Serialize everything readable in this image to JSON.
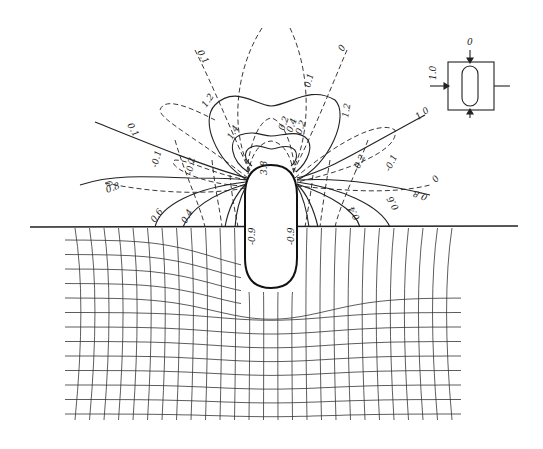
{
  "figure": {
    "type": "stress contour diagram with deformation grid",
    "contour_labels": {
      "solid": [
        "0.1",
        "0.8",
        "0.6",
        "0.4",
        "1.2",
        "1.4",
        "1.0",
        "0.8",
        "0.6",
        "0.4",
        "1.2",
        "3.8",
        "-0.9",
        "-0.9"
      ],
      "dashed": [
        "0.1",
        "0",
        "-0.1",
        "-0.2",
        "0.2",
        "0.4",
        "0.2",
        "0.1",
        "0",
        "-0.1",
        "-0.2"
      ]
    },
    "labels": {
      "top_left_01": "0.1",
      "top_mid_01": "0.1",
      "top_right_0": "0",
      "left_upper_1_2": "1.2",
      "right_upper_1_2": "1.2",
      "inner_1_4": "1.4",
      "inner_0_2a": "0.2",
      "inner_0_4": "0.4",
      "inner_0_2b": "0.2",
      "left_0_1": "0.1",
      "left_neg_0_1": "-0.1",
      "left_neg_0_2": "-0.2",
      "left_0": "0",
      "left_0_8": "0.8",
      "left_0_6": "0.6",
      "left_0_4": "0.4",
      "right_1_0": "1.0",
      "right_neg_0_2": "-0.2",
      "right_neg_0_1": "-0.1",
      "right_0": "0",
      "right_0_8": "0.8",
      "right_0_6": "0.6",
      "right_0_4": "0.4",
      "tip_3_8": "3.8",
      "side_left_neg_0_9": "-0.9",
      "side_right_neg_0_9": "-0.9"
    },
    "inset": {
      "top_label": "0",
      "left_label": "1.0"
    }
  }
}
